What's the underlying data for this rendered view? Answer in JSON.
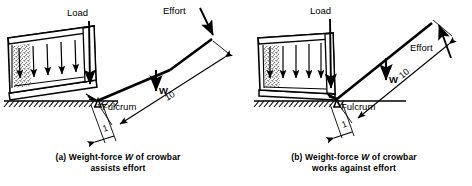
{
  "figure": {
    "line_color": "#000000",
    "background_color": "#ffffff"
  },
  "panels": [
    {
      "id": "a",
      "caption_line1_prefix": "(a) Weight-force ",
      "caption_symbol": "W",
      "caption_line1_suffix": " of crowbar",
      "caption_line2": "assists effort",
      "labels": {
        "load": "Load",
        "effort": "Effort",
        "weight": "W",
        "fulcrum": "Fulcrum",
        "dim_long": "10",
        "dim_short": "1"
      }
    },
    {
      "id": "b",
      "caption_line1_prefix": "(b) Weight-force ",
      "caption_symbol": "W",
      "caption_line1_suffix": " of crowbar",
      "caption_line2": "works against effort",
      "labels": {
        "load": "Load",
        "effort": "Effort",
        "weight": "W",
        "fulcrum": "Fulcrum",
        "dim_long": "10",
        "dim_short": "1"
      }
    }
  ]
}
